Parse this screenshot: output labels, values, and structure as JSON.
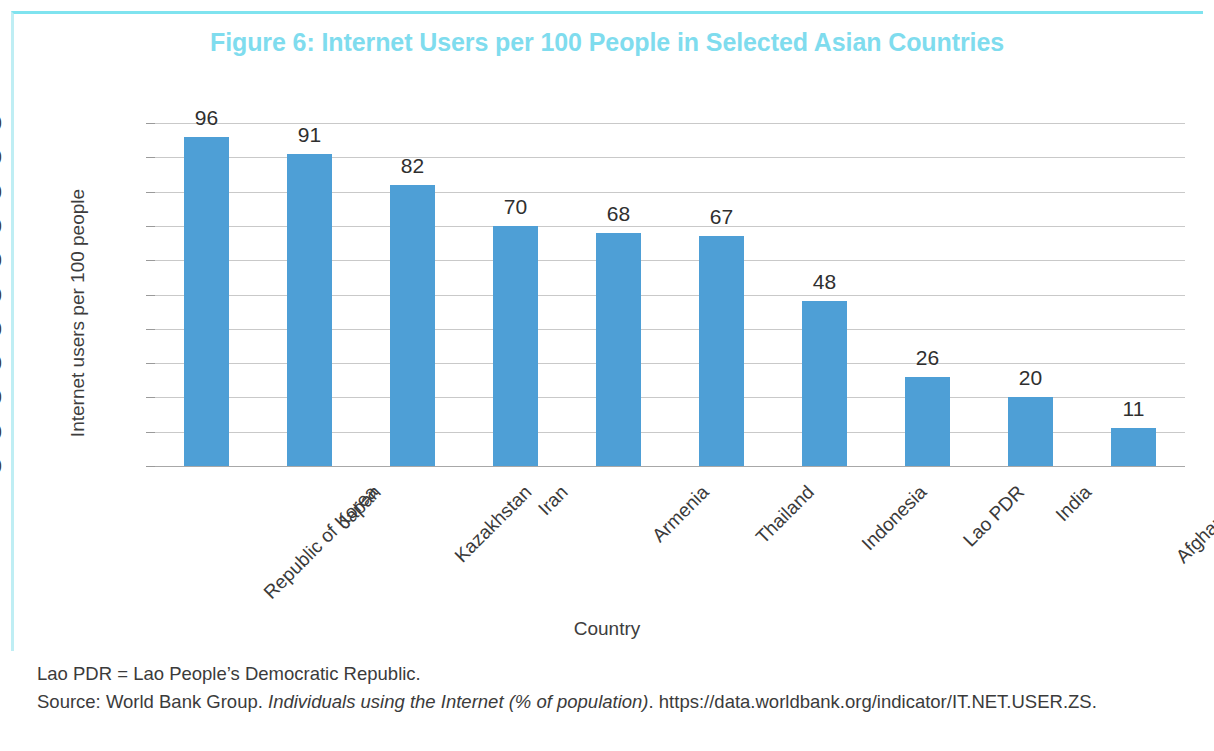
{
  "figure": {
    "title": "Figure 6: Internet Users per 100 People in Selected Asian Countries",
    "title_color": "#7fdcee",
    "frame_color": "#7fe3ef"
  },
  "footnotes": {
    "abbreviation": "Lao PDR = Lao People’s Democratic Republic.",
    "source_prefix": "Source: World Bank Group. ",
    "source_italic": "Individuals using the Internet (% of population)",
    "source_suffix": ". https://data.worldbank.org/indicator/IT.NET.USER.ZS."
  },
  "chart_data": {
    "type": "bar",
    "title": "Figure 6: Internet Users per 100 People in Selected Asian Countries",
    "xlabel": "Country",
    "ylabel": "Internet users per 100 people",
    "ylim": [
      0,
      100
    ],
    "yticks": [
      100,
      90,
      80,
      70,
      60,
      50,
      40,
      30,
      20,
      10,
      0
    ],
    "grid": true,
    "legend": false,
    "bar_color": "#4e9fd6",
    "categories": [
      "Republic of Korea",
      "Japan",
      "Kazakhstan",
      "Iran",
      "Armenia",
      "Thailand",
      "Indonesia",
      "Lao PDR",
      "India",
      "Afghanistan"
    ],
    "values": [
      96,
      91,
      82,
      70,
      68,
      67,
      48,
      26,
      20,
      11
    ],
    "data_labels": [
      "96",
      "91",
      "82",
      "70",
      "68",
      "67",
      "48",
      "26",
      "20",
      "11"
    ]
  }
}
